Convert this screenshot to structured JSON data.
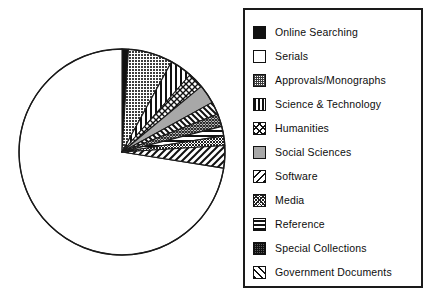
{
  "chart_data": {
    "type": "pie",
    "title": "",
    "subtitle": "",
    "xlabel": "",
    "ylabel": "",
    "grid": false,
    "legend_position": "right",
    "start_angle_deg": 0,
    "direction": "clockwise",
    "units": "percent",
    "categories": [
      "Online Searching",
      "Serials",
      "Approvals/Monographs",
      "Science & Technology",
      "Humanities",
      "Social Sciences",
      "Software",
      "Media",
      "Reference",
      "Special Collections",
      "Government Documents"
    ],
    "values": [
      1.0,
      73.0,
      7.0,
      3.5,
      2.5,
      3.0,
      2.0,
      2.0,
      1.5,
      1.5,
      3.0
    ],
    "slices": [
      {
        "label": "Online Searching",
        "value": 1.0,
        "pattern": "solid-black",
        "fill": "#111111",
        "start_deg": 0.0,
        "end_deg": 3.6
      },
      {
        "label": "Serials",
        "value": 73.0,
        "pattern": "solid-white",
        "fill": "#ffffff",
        "start_deg": 99.0,
        "end_deg": 360.0
      },
      {
        "label": "Approvals/Monographs",
        "value": 7.0,
        "pattern": "dense-dots",
        "fill": "#666666",
        "start_deg": 3.6,
        "end_deg": 28.8
      },
      {
        "label": "Science & Technology",
        "value": 3.5,
        "pattern": "vertical-lines",
        "fill": "#ffffff",
        "start_deg": 28.8,
        "end_deg": 41.4
      },
      {
        "label": "Humanities",
        "value": 2.5,
        "pattern": "cross-hatch",
        "fill": "#ffffff",
        "start_deg": 41.4,
        "end_deg": 50.4
      },
      {
        "label": "Social Sciences",
        "value": 3.0,
        "pattern": "light-gray",
        "fill": "#a8a8a8",
        "start_deg": 50.4,
        "end_deg": 61.2
      },
      {
        "label": "Software",
        "value": 2.0,
        "pattern": "back-diagonal",
        "fill": "#ffffff",
        "start_deg": 61.2,
        "end_deg": 68.4
      },
      {
        "label": "Media",
        "value": 2.0,
        "pattern": "fine-crosshatch",
        "fill": "#ffffff",
        "start_deg": 68.4,
        "end_deg": 75.6
      },
      {
        "label": "Reference",
        "value": 1.5,
        "pattern": "horizontal-lines",
        "fill": "#ffffff",
        "start_deg": 75.6,
        "end_deg": 81.0
      },
      {
        "label": "Special Collections",
        "value": 1.5,
        "pattern": "dense-dots-dark",
        "fill": "#4d4d4d",
        "start_deg": 81.0,
        "end_deg": 86.4
      },
      {
        "label": "Government Documents",
        "value": 3.0,
        "pattern": "forward-diagonal",
        "fill": "#ffffff",
        "start_deg": 86.4,
        "end_deg": 99.0
      }
    ]
  },
  "pie": {
    "center_x": 122,
    "center_y": 152,
    "radius": 103,
    "outline_color": "#1a1a1a"
  },
  "legend": {
    "border_color": "#1a1a1a",
    "items": [
      {
        "label": "Online Searching",
        "pattern": "solid-black"
      },
      {
        "label": "Serials",
        "pattern": "solid-white"
      },
      {
        "label": "Approvals/Monographs",
        "pattern": "dense-dots"
      },
      {
        "label": "Science & Technology",
        "pattern": "vertical-lines"
      },
      {
        "label": "Humanities",
        "pattern": "cross-hatch"
      },
      {
        "label": "Social Sciences",
        "pattern": "light-gray"
      },
      {
        "label": "Software",
        "pattern": "back-diagonal"
      },
      {
        "label": "Media",
        "pattern": "fine-crosshatch"
      },
      {
        "label": "Reference",
        "pattern": "horizontal-lines"
      },
      {
        "label": "Special Collections",
        "pattern": "dense-dots-dark"
      },
      {
        "label": "Government Documents",
        "pattern": "forward-diagonal"
      }
    ]
  }
}
